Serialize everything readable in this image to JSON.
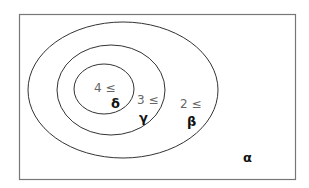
{
  "diagram": {
    "type": "nested-sets",
    "frame": {
      "label": "α"
    },
    "sets": [
      {
        "name": "beta",
        "threshold_label": "2 ≤",
        "symbol": "β"
      },
      {
        "name": "gamma",
        "threshold_label": "3 ≤",
        "symbol": "γ"
      },
      {
        "name": "delta",
        "threshold_label": "4 ≤",
        "symbol": "δ"
      }
    ]
  }
}
